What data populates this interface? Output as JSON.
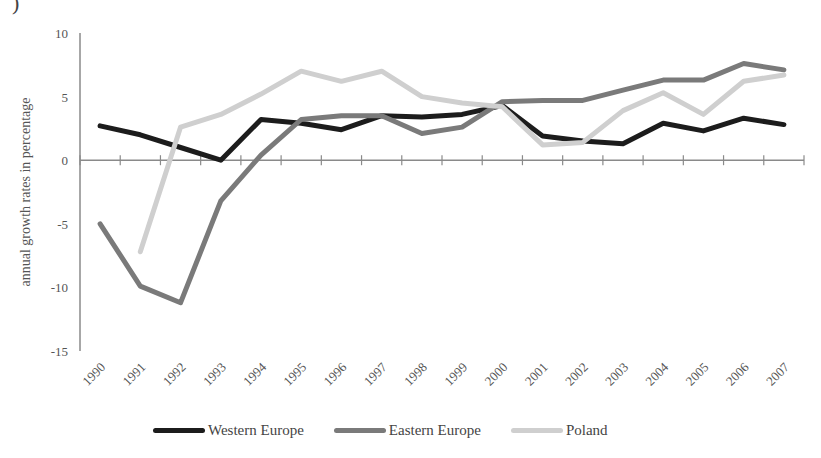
{
  "corner_mark": ")",
  "chart_data": {
    "type": "line",
    "title": "",
    "xlabel": "",
    "ylabel": "annual growth rates in percentage",
    "ylim": [
      -15,
      10
    ],
    "yticks": [
      10,
      5,
      0,
      -5,
      -10,
      -15
    ],
    "ytick_labels": [
      "10",
      "5",
      "0",
      "-5",
      "-10",
      "-15"
    ],
    "grid": false,
    "legend_position": "bottom",
    "categories": [
      "1990",
      "1991",
      "1992",
      "1993",
      "1994",
      "1995",
      "1996",
      "1997",
      "1998",
      "1999",
      "2000",
      "2001",
      "2002",
      "2003",
      "2004",
      "2005",
      "2006",
      "2007"
    ],
    "series": [
      {
        "name": "Western Europe",
        "color": "#1c1c1c",
        "values": [
          2.7,
          2.0,
          1.0,
          0.0,
          3.2,
          2.9,
          2.4,
          3.5,
          3.4,
          3.6,
          4.3,
          1.9,
          1.5,
          1.3,
          2.9,
          2.3,
          3.3,
          2.8
        ]
      },
      {
        "name": "Eastern Europe",
        "color": "#7a7a7a",
        "values": [
          -5.0,
          -9.9,
          -11.2,
          -3.2,
          0.4,
          3.2,
          3.5,
          3.5,
          2.1,
          2.6,
          4.6,
          4.7,
          4.7,
          5.5,
          6.3,
          6.3,
          7.6,
          7.1
        ]
      },
      {
        "name": "Poland",
        "color": "#cfcfcf",
        "values": [
          null,
          -7.2,
          2.6,
          3.6,
          5.2,
          7.0,
          6.2,
          7.0,
          5.0,
          4.5,
          4.2,
          1.2,
          1.4,
          3.9,
          5.3,
          3.6,
          6.2,
          6.7
        ]
      }
    ]
  },
  "legend": {
    "items": [
      {
        "label": "Western Europe",
        "color": "#1c1c1c"
      },
      {
        "label": "Eastern Europe",
        "color": "#7a7a7a"
      },
      {
        "label": "Poland",
        "color": "#cfcfcf"
      }
    ]
  },
  "colors": {
    "axis": "#8a8a8a"
  }
}
